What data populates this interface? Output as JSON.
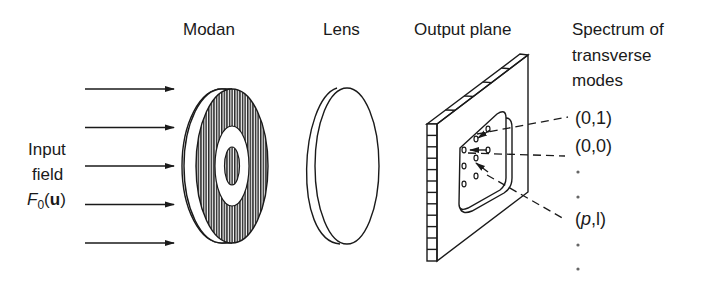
{
  "labels": {
    "modan": "Modan",
    "lens": "Lens",
    "output_plane": "Output plane",
    "spectrum_line1": "Spectrum of",
    "spectrum_line2": "transverse",
    "spectrum_line3": "modes"
  },
  "input": {
    "line1": "Input",
    "line2": "field",
    "symbol_main": "F",
    "symbol_sub": "0",
    "symbol_arg_open": "(",
    "symbol_arg": "u",
    "symbol_arg_close": ")",
    "arrow_count": 5
  },
  "modes": [
    {
      "label": "(0,1)",
      "italic_part": ""
    },
    {
      "label": "(0,0)",
      "italic_part": ""
    },
    {
      "label": "·"
    },
    {
      "label": "·"
    },
    {
      "label_open": "(",
      "label_italic": "p",
      "label_rest": ",l)"
    },
    {
      "label": "·"
    },
    {
      "label": "·"
    }
  ],
  "colors": {
    "ink": "#1a1a1a",
    "background": "#ffffff",
    "hatch": "#2a2a2a"
  }
}
